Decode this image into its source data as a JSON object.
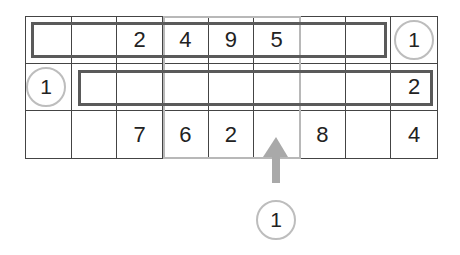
{
  "puzzle": {
    "rows": 3,
    "cols": 9,
    "cells": [
      [
        "",
        "",
        "2",
        "4",
        "9",
        "5",
        "",
        "",
        "1"
      ],
      [
        "1",
        "",
        "",
        "",
        "",
        "",
        "",
        "",
        "2"
      ],
      [
        "",
        "",
        "7",
        "6",
        "2",
        "",
        "8",
        "",
        "4"
      ]
    ],
    "clues": [
      {
        "id": "row1-right",
        "value": "1"
      },
      {
        "id": "row2-left",
        "value": "1"
      },
      {
        "id": "column-bottom",
        "value": "1"
      }
    ],
    "highlight_columns": [
      4,
      6
    ],
    "colors": {
      "grid_line": "#444444",
      "cage_border": "#5a5a5a",
      "highlight_border": "#b8b8b8",
      "arrow": "#a9a9a9",
      "clue_circle": "#bdbdbd"
    }
  }
}
